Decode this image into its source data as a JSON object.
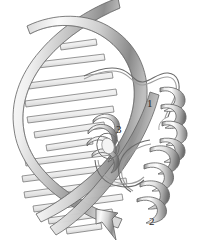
{
  "figure": {
    "background_color": "#ffffff",
    "width": 199,
    "height": 247
  },
  "labels": {
    "helix_1": "1",
    "helix_3": "3",
    "helix_2": "2"
  },
  "colors": {
    "ribbon_light": "#f2f2f2",
    "ribbon_mid": "#bdbdbd",
    "ribbon_dark": "#6e6e6e",
    "outline": "#555555",
    "label_text": "#262626",
    "rung_fill": "#e8e8e8"
  },
  "structures": {
    "dna": {
      "name": "dna-double-helix",
      "form": "B-DNA",
      "strand_count": 2,
      "representation": "ribbon",
      "base_pair_rungs": 13,
      "has_terminal_arrowhead": true
    },
    "protein": {
      "name": "helix-turn-helix-motif",
      "representation": "ribbon-coil",
      "helix_count": 3,
      "helices": [
        {
          "id": "1",
          "label": "1",
          "orientation": "vertical-front-right"
        },
        {
          "id": "2",
          "label": "2",
          "orientation": "lower-front-right"
        },
        {
          "id": "3",
          "label": "3",
          "orientation": "recognition-helix-in-major-groove"
        }
      ],
      "loops": [
        {
          "name": "n-terminal-loop",
          "position": "top"
        },
        {
          "name": "turn-loop",
          "position": "between-helix-1-and-2"
        }
      ]
    }
  }
}
